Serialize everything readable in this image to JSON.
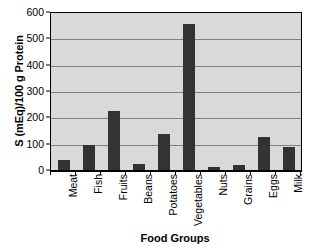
{
  "chart_data": {
    "type": "bar",
    "title": "",
    "xlabel": "Food Groups",
    "ylabel": "S (mEq)/100 g Protein",
    "categories": [
      "Meat",
      "Fish",
      "Fruits",
      "Beans",
      "Potatoes",
      "Vegetables",
      "Nuts",
      "Grains",
      "Eggs",
      "Milk"
    ],
    "values": [
      42,
      100,
      228,
      28,
      140,
      560,
      15,
      24,
      128,
      92
    ],
    "ylim": [
      0,
      600
    ],
    "yticks": [
      0,
      100,
      200,
      300,
      400,
      500,
      600
    ],
    "ytick_labels": [
      "0",
      "100",
      "200",
      "300",
      "400",
      "500",
      "600"
    ],
    "grid": true,
    "legend": false,
    "bar_color": "#333333",
    "plot_background": "#d9d9d9",
    "gridline_color": "#808080",
    "axis_color": "#000000"
  }
}
